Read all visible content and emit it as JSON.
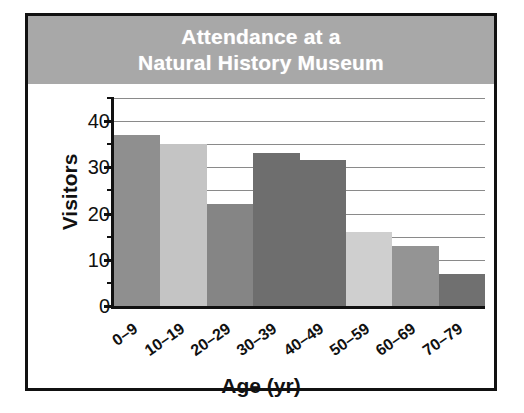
{
  "figure": {
    "border_color": "#111111",
    "background_color": "#ffffff",
    "banner_color": "#a8a8a8",
    "title_line_1": "Attendance at a",
    "title_line_2": "Natural History Museum"
  },
  "chart_data": {
    "type": "bar",
    "title": "Attendance at a Natural History Museum",
    "xlabel": "Age (yr)",
    "ylabel": "Visitors",
    "categories": [
      "0–9",
      "10–19",
      "20–29",
      "30–39",
      "40–49",
      "50–59",
      "60–69",
      "70–79"
    ],
    "values": [
      37,
      35,
      22,
      33,
      31.5,
      16,
      13,
      7
    ],
    "bar_colors": [
      "#8f8f8f",
      "#c4c4c4",
      "#858585",
      "#6e6e6e",
      "#6e6e6e",
      "#cfcfcf",
      "#949494",
      "#707070"
    ],
    "ylim": [
      0,
      45
    ],
    "ytick_labels": [
      "0",
      "10",
      "20",
      "30",
      "40"
    ],
    "ytick_values": [
      0,
      10,
      20,
      30,
      40
    ],
    "yminor_step": 5,
    "grid": true,
    "grid_color": "#8a8a8a",
    "legend": "none",
    "bar_gap": 0
  }
}
